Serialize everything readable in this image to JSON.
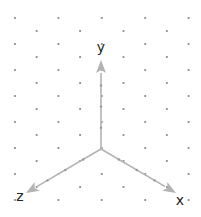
{
  "diagram": {
    "type": "isometric-axes",
    "grid": {
      "dot_color": "#888888",
      "dot_radius": 1.1,
      "x0": 15,
      "col_spacing": 21.7,
      "y0": 18,
      "row_spacing": 13,
      "cols": 9,
      "rows": 15
    },
    "origin": {
      "x": 101,
      "y": 149
    },
    "axis_color": "#b3b3b3",
    "axes": [
      {
        "name": "x",
        "label": "x",
        "tip": {
          "x": 176,
          "y": 193
        },
        "label_pos": {
          "x": 180,
          "y": 205
        }
      },
      {
        "name": "y",
        "label": "y",
        "tip": {
          "x": 101,
          "y": 60
        },
        "label_pos": {
          "x": 101,
          "y": 52
        }
      },
      {
        "name": "z",
        "label": "z",
        "tip": {
          "x": 26,
          "y": 193
        },
        "label_pos": {
          "x": 20,
          "y": 201
        }
      }
    ]
  }
}
